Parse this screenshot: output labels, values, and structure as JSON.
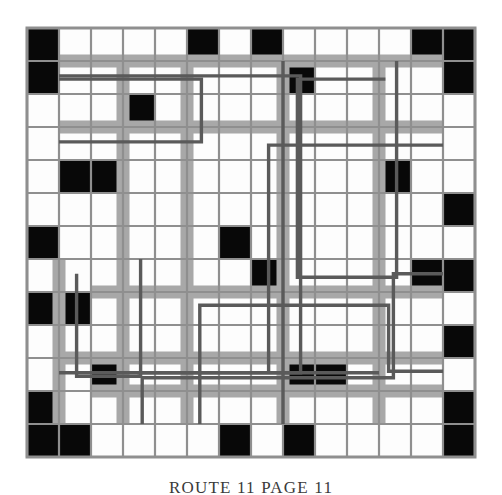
{
  "figure": {
    "kind": "routing-grid-diagram",
    "caption": "ROUTE 11  PAGE 11",
    "grid": {
      "columns": 14,
      "rows": 13,
      "origin_x": 27,
      "origin_y": 28,
      "cell_w": 32,
      "cell_h": 33
    },
    "colors": {
      "background": "#ffffff",
      "cell_fill": "#fdfdfd",
      "blocked_fill": "#080808",
      "grid_line": "#8f8f8f",
      "corridor_band": "#a8a8a8",
      "route_line": "#5a5a5a",
      "caption_text": "#3a3a3a"
    },
    "blocked_cells": [
      [
        1,
        1
      ],
      [
        1,
        6
      ],
      [
        1,
        8
      ],
      [
        1,
        13
      ],
      [
        1,
        14
      ],
      [
        2,
        1
      ],
      [
        2,
        9
      ],
      [
        2,
        14
      ],
      [
        3,
        4
      ],
      [
        5,
        2
      ],
      [
        5,
        3
      ],
      [
        5,
        12
      ],
      [
        6,
        14
      ],
      [
        7,
        1
      ],
      [
        7,
        7
      ],
      [
        8,
        8
      ],
      [
        8,
        13
      ],
      [
        8,
        14
      ],
      [
        9,
        1
      ],
      [
        9,
        2
      ],
      [
        10,
        14
      ],
      [
        11,
        3
      ],
      [
        11,
        9
      ],
      [
        11,
        10
      ],
      [
        12,
        1
      ],
      [
        12,
        14
      ],
      [
        13,
        1
      ],
      [
        13,
        2
      ],
      [
        13,
        7
      ],
      [
        13,
        9
      ],
      [
        13,
        14
      ]
    ],
    "corridor_bands": {
      "horizontal": [
        {
          "row_line": 2,
          "col_start": 2,
          "col_end": 14
        },
        {
          "row_line": 4,
          "col_start": 2,
          "col_end": 14
        },
        {
          "row_line": 9,
          "col_start": 3,
          "col_end": 14
        },
        {
          "row_line": 11,
          "col_start": 2,
          "col_end": 14
        },
        {
          "row_line": 12,
          "col_start": 3,
          "col_end": 14
        }
      ],
      "vertical": [
        {
          "col_line": 4,
          "row_start": 2,
          "row_end": 13
        },
        {
          "col_line": 6,
          "row_start": 2,
          "row_end": 13
        },
        {
          "col_line": 9,
          "row_start": 2,
          "row_end": 13
        },
        {
          "col_line": 12,
          "row_start": 2,
          "row_end": 13
        },
        {
          "col_line": 2,
          "row_start": 8,
          "row_end": 13
        }
      ]
    },
    "routes": [
      {
        "id": "route-a",
        "points": [
          [
            2.0,
            2.55
          ],
          [
            6.45,
            2.55
          ],
          [
            6.45,
            4.45
          ],
          [
            2.0,
            4.45
          ]
        ]
      },
      {
        "id": "route-b",
        "points": [
          [
            2.0,
            2.45
          ],
          [
            9.55,
            2.45
          ],
          [
            9.55,
            11.45
          ],
          [
            4.45,
            11.45
          ]
        ]
      },
      {
        "id": "route-c",
        "points": [
          [
            12.55,
            2.0
          ],
          [
            12.55,
            8.55
          ],
          [
            9.45,
            8.55
          ],
          [
            9.45,
            2.55
          ],
          [
            12.2,
            2.55
          ]
        ]
      },
      {
        "id": "route-d",
        "points": [
          [
            4.55,
            8.0
          ],
          [
            4.55,
            11.55
          ],
          [
            2.55,
            11.55
          ],
          [
            2.55,
            8.45
          ]
        ]
      },
      {
        "id": "route-e",
        "points": [
          [
            14.0,
            8.45
          ],
          [
            12.45,
            8.45
          ],
          [
            12.45,
            11.6
          ],
          [
            4.6,
            11.6
          ],
          [
            4.6,
            13.0
          ]
        ]
      },
      {
        "id": "route-f",
        "points": [
          [
            9.0,
            2.0
          ],
          [
            9.0,
            13.0
          ]
        ]
      },
      {
        "id": "route-g",
        "points": [
          [
            14.0,
            11.4
          ],
          [
            12.3,
            11.4
          ],
          [
            12.3,
            9.4
          ],
          [
            6.4,
            9.4
          ],
          [
            6.4,
            13.0
          ]
        ]
      },
      {
        "id": "route-h",
        "points": [
          [
            14.0,
            4.55
          ],
          [
            8.55,
            4.55
          ],
          [
            8.55,
            11.4
          ]
        ]
      },
      {
        "id": "route-i",
        "points": [
          [
            2.0,
            11.45
          ],
          [
            12.0,
            11.45
          ]
        ]
      }
    ]
  }
}
